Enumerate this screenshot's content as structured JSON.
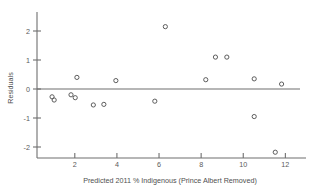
{
  "chart_data": {
    "type": "scatter",
    "title": "",
    "xlabel": "Predicted 2011 % Indigenous (Prince Albert Removed)",
    "ylabel": "Residuals",
    "xlim": [
      0.3,
      12.6
    ],
    "ylim": [
      -2.45,
      2.45
    ],
    "xticks": [
      2,
      4,
      6,
      8,
      10,
      12
    ],
    "xtick_labels": [
      "2",
      "4",
      "6",
      "8",
      "10",
      "12"
    ],
    "yticks": [
      2,
      1,
      0,
      -1,
      -2
    ],
    "ytick_labels": [
      "2",
      "1",
      "0",
      "-1",
      "-2"
    ],
    "grid": false,
    "legend": null,
    "reference_line": {
      "type": "horizontal",
      "y": 0
    },
    "marker": {
      "shape": "open-circle",
      "color": "#5c5c5c",
      "radius": 2.1
    },
    "points": [
      {
        "x": 0.92,
        "y": -0.27
      },
      {
        "x": 1.02,
        "y": -0.38
      },
      {
        "x": 1.82,
        "y": -0.2
      },
      {
        "x": 2.02,
        "y": -0.3
      },
      {
        "x": 2.1,
        "y": 0.4
      },
      {
        "x": 2.88,
        "y": -0.55
      },
      {
        "x": 3.38,
        "y": -0.53
      },
      {
        "x": 3.95,
        "y": 0.29
      },
      {
        "x": 5.8,
        "y": -0.42
      },
      {
        "x": 6.3,
        "y": 2.15
      },
      {
        "x": 8.22,
        "y": 0.32
      },
      {
        "x": 8.68,
        "y": 1.1
      },
      {
        "x": 9.22,
        "y": 1.1
      },
      {
        "x": 10.52,
        "y": 0.35
      },
      {
        "x": 10.52,
        "y": -0.95
      },
      {
        "x": 11.52,
        "y": -2.18
      },
      {
        "x": 11.82,
        "y": 0.17
      }
    ]
  },
  "colors": {
    "axis": "#6f6f6f",
    "marker": "#5c5c5c",
    "text": "#4f4f4f",
    "background": "#ffffff"
  }
}
